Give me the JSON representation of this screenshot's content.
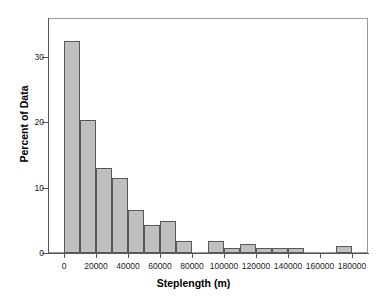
{
  "chart_data": {
    "type": "bar",
    "title": "",
    "subtitle": "",
    "xlabel": "Steplength (m)",
    "ylabel": "Percent of Data",
    "xlim": [
      -10000,
      190000
    ],
    "ylim": [
      0,
      36
    ],
    "grid": false,
    "legend": null,
    "bin_width": 10000,
    "categories": [
      "0-10000",
      "10000-20000",
      "20000-30000",
      "30000-40000",
      "40000-50000",
      "50000-60000",
      "60000-70000",
      "70000-80000",
      "80000-90000",
      "90000-100000",
      "100000-110000",
      "110000-120000",
      "120000-130000",
      "130000-140000",
      "140000-150000",
      "150000-160000",
      "160000-170000",
      "170000-180000"
    ],
    "bin_starts": [
      0,
      10000,
      20000,
      30000,
      40000,
      50000,
      60000,
      70000,
      80000,
      90000,
      100000,
      110000,
      120000,
      130000,
      140000,
      150000,
      160000,
      170000
    ],
    "values": [
      32.5,
      20.4,
      13.0,
      11.5,
      6.6,
      4.3,
      4.9,
      1.8,
      0.0,
      1.9,
      0.8,
      1.4,
      0.7,
      0.7,
      0.8,
      0.0,
      0.0,
      1.0
    ],
    "bar_color": "#bfbfbf",
    "bar_edge_color": "#595959",
    "axis_color": "#555555",
    "ytick_values": [
      0,
      10,
      20,
      30
    ],
    "ytick_labels": [
      "0",
      "10",
      "20",
      "30"
    ],
    "xtick_values": [
      0,
      20000,
      40000,
      60000,
      80000,
      100000,
      120000,
      140000,
      160000,
      180000
    ],
    "xtick_labels": [
      "0",
      "20000",
      "40000",
      "60000",
      "80000",
      "100000",
      "120000",
      "140000",
      "160000",
      "180000"
    ]
  }
}
